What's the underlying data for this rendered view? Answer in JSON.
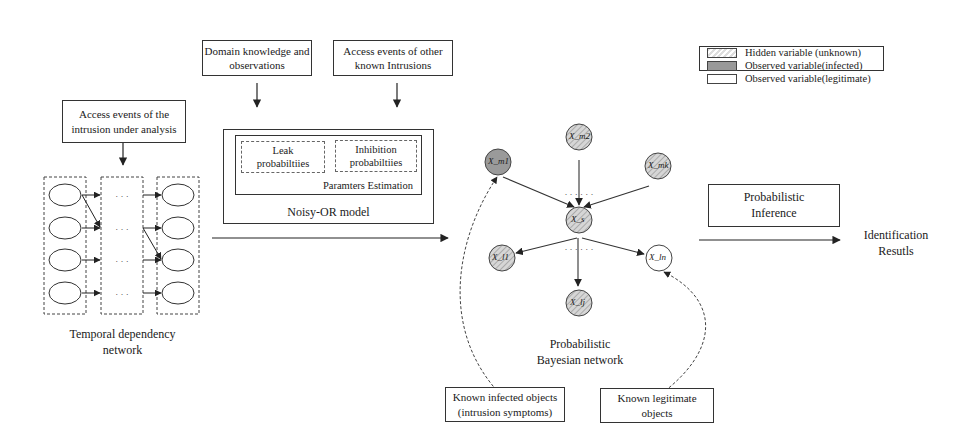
{
  "input_box": {
    "line1": "Access events of the",
    "line2": "intrusion under analysis"
  },
  "temporal_network": {
    "label_line1": "Temporal dependency",
    "label_line2": "network",
    "ellipsis": "· · ·"
  },
  "domain_box": {
    "line1": "Domain knowledge and",
    "line2": "observations"
  },
  "other_intrusions_box": {
    "line1": "Access events of other",
    "line2": "known Intrusions"
  },
  "noisy_or": {
    "title": "Noisy-OR model",
    "params_title": "Paramters Estimation",
    "leak": {
      "line1": "Leak",
      "line2": "probabiltiies"
    },
    "inhibition": {
      "line1": "Inhibition",
      "line2": "probabiltiies"
    }
  },
  "legend": {
    "items": [
      {
        "label": "Hidden variable (unknown)",
        "fill": "hatched"
      },
      {
        "label": "Observed variable(infected)",
        "fill": "#999999"
      },
      {
        "label": "Observed variable(legitimate)",
        "fill": "#ffffff"
      }
    ]
  },
  "bayesian_network": {
    "label_line1": "Probabilistic",
    "label_line2": "Bayesian network",
    "nodes": {
      "infected": "X_m1",
      "top": "X_m2",
      "right_top": "X_mk",
      "center": "X_s",
      "left_bottom": "X_l1",
      "bottom": "X_lj",
      "legit": "X_ln"
    },
    "dots": "· · ·  · · ·"
  },
  "inference_box": {
    "line1": "Probabilistic",
    "line2": "Inference"
  },
  "output": {
    "line1": "Identification",
    "line2": "Resutls"
  },
  "infected_box": {
    "line1": "Known infected objects",
    "line2": "(intrusion symptoms)"
  },
  "legit_box": {
    "line1": "Known legitimate",
    "line2": "objects"
  },
  "colors": {
    "line": "#333333",
    "infected_fill": "#9a9a9a",
    "hidden_fill": "#d8d8d8"
  }
}
